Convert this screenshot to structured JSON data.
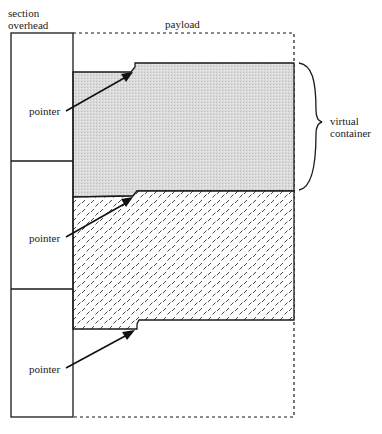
{
  "diagram": {
    "labels": {
      "section_overhead_line1": "section",
      "section_overhead_line2": "overhead",
      "payload": "payload",
      "virtual_container_line1": "virtual",
      "virtual_container_line2": "container",
      "pointer_1": "pointer",
      "pointer_2": "pointer",
      "pointer_3": "pointer"
    },
    "colors": {
      "stroke": "#1a1a1a",
      "vc_fill": "#d6d6d6",
      "hatch_fill": "#ffffff",
      "background": "#ffffff"
    },
    "frames": [
      {
        "name": "frame-1",
        "has_pointer": true
      },
      {
        "name": "frame-2",
        "has_pointer": true
      },
      {
        "name": "frame-3",
        "has_pointer": true
      }
    ]
  }
}
